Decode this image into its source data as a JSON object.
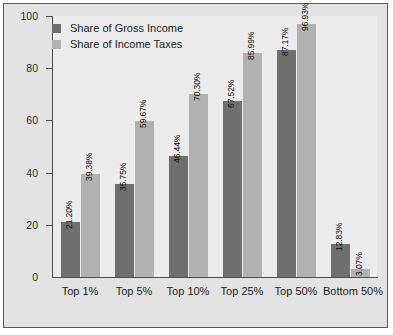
{
  "chart_data": {
    "type": "bar",
    "title": "",
    "xlabel": "",
    "ylabel": "",
    "ylim": [
      0,
      100
    ],
    "yticks": [
      0,
      20,
      40,
      60,
      80,
      100
    ],
    "ytick_labels": [
      "0",
      "20",
      "40",
      "60",
      "80",
      "100"
    ],
    "grid": false,
    "legend_position": "top-left",
    "categories": [
      "Top 1%",
      "Top 5%",
      "Top 10%",
      "Top 25%",
      "Top 50%",
      "Bottom 50%"
    ],
    "series": [
      {
        "name": "Share of Gross Income",
        "color": "#6f6f6f",
        "values": [
          21.2,
          35.75,
          46.44,
          67.52,
          87.17,
          12.83
        ],
        "labels": [
          "21.20%",
          "35.75%",
          "46.44%",
          "67.52%",
          "87.17%",
          "12.83%"
        ]
      },
      {
        "name": "Share of Income Taxes",
        "color": "#b1b1b1",
        "values": [
          39.38,
          59.67,
          70.3,
          85.99,
          96.93,
          3.07
        ],
        "labels": [
          "39.38%",
          "59.67%",
          "70.30%",
          "85.99%",
          "96.93%",
          "3.07%"
        ]
      }
    ]
  },
  "legend": {
    "items": [
      {
        "label": "Share of Gross Income",
        "swatch": "gross"
      },
      {
        "label": "Share of Income Taxes",
        "swatch": "taxes"
      }
    ]
  },
  "colors": {
    "series_gross": "#6f6f6f",
    "series_taxes": "#b1b1b1",
    "plot_background": "#ebebeb",
    "figure_background": "#e2e2e2",
    "axis": "#4d4d4d"
  }
}
